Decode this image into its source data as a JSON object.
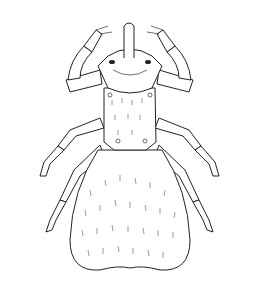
{
  "image": {
    "subject": "mite/louse scientific line illustration",
    "background": "#ffffff",
    "line_color": "#222222"
  }
}
